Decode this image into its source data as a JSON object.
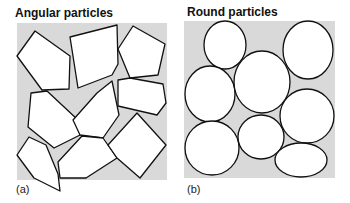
{
  "panel_a": {
    "title": "Angular particles",
    "label": "(a)",
    "background": "#d9d9d9",
    "particles": [
      "17,56 35,31 70,56 69,89 42,90",
      "70,37 117,25 118,64 112,75 78,88",
      "118,49 133,26 165,44 158,75 130,78",
      "31,93 47,91 78,120 80,135 54,148 28,127",
      "73,120 97,93 112,81 119,115 103,138 80,135",
      "118,80 130,78 163,84 166,103 157,115 118,106",
      "29,137 46,145 58,174 60,191 34,178 17,155",
      "58,162 82,136 103,138 117,158 86,178 60,178",
      "108,145 137,113 166,145 140,178 117,158"
    ]
  },
  "panel_b": {
    "title": "Round particles",
    "label": "(b)",
    "background": "#d9d9d9",
    "particles": [
      {
        "cx": 225,
        "cy": 45,
        "rx": 21,
        "ry": 24
      },
      {
        "cx": 308,
        "cy": 50,
        "rx": 25,
        "ry": 29
      },
      {
        "cx": 210,
        "cy": 94,
        "rx": 25,
        "ry": 28
      },
      {
        "cx": 262,
        "cy": 82,
        "rx": 28,
        "ry": 31
      },
      {
        "cx": 307,
        "cy": 116,
        "rx": 27,
        "ry": 27
      },
      {
        "cx": 212,
        "cy": 148,
        "rx": 27,
        "ry": 27
      },
      {
        "cx": 261,
        "cy": 137,
        "rx": 23,
        "ry": 22
      },
      {
        "cx": 301,
        "cy": 160,
        "rx": 26,
        "ry": 17
      }
    ]
  }
}
